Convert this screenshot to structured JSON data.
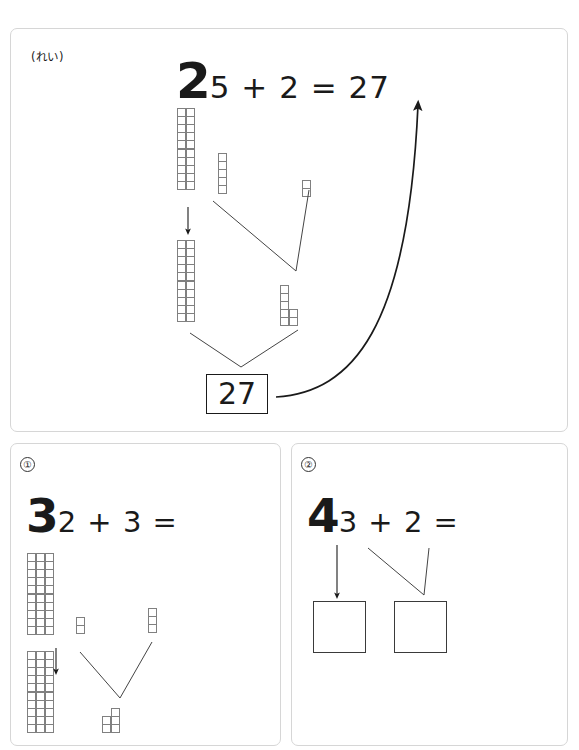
{
  "page": {
    "top_note": "",
    "background_color": "#ffffff",
    "ink_color": "#1a1a1a",
    "tile_stroke_color": "#808080",
    "panel_border_color": "#d6d6d6"
  },
  "panels": [
    {
      "id": "example",
      "tag": "(れい)",
      "equation": {
        "lead": "2",
        "rest": "5 + 2 = 27"
      },
      "answer_box": "27",
      "top_row": {
        "tens_label": "2 tens",
        "tens_columns": 2,
        "tens_cells_per_column": 10,
        "ones_a": 5,
        "ones_b": 2
      },
      "bottom_row": {
        "tens_columns": 2,
        "tens_cells_per_column": 10,
        "ones_a": 5,
        "ones_b": 2
      }
    },
    {
      "id": "q1",
      "tag": "①",
      "equation": {
        "lead": "3",
        "rest": "2 + 3 ="
      },
      "answer_box": "",
      "top_row": {
        "tens_columns": 3,
        "tens_cells_per_column": 10,
        "ones_a": 2,
        "ones_b": 3
      },
      "bottom_row": {
        "tens_columns": 3,
        "tens_cells_per_column": 10,
        "ones_a": 2,
        "ones_b": 3
      }
    },
    {
      "id": "q2",
      "tag": "②",
      "equation": {
        "lead": "4",
        "rest": "3 + 2 ="
      },
      "box_a": "",
      "box_b": ""
    }
  ]
}
